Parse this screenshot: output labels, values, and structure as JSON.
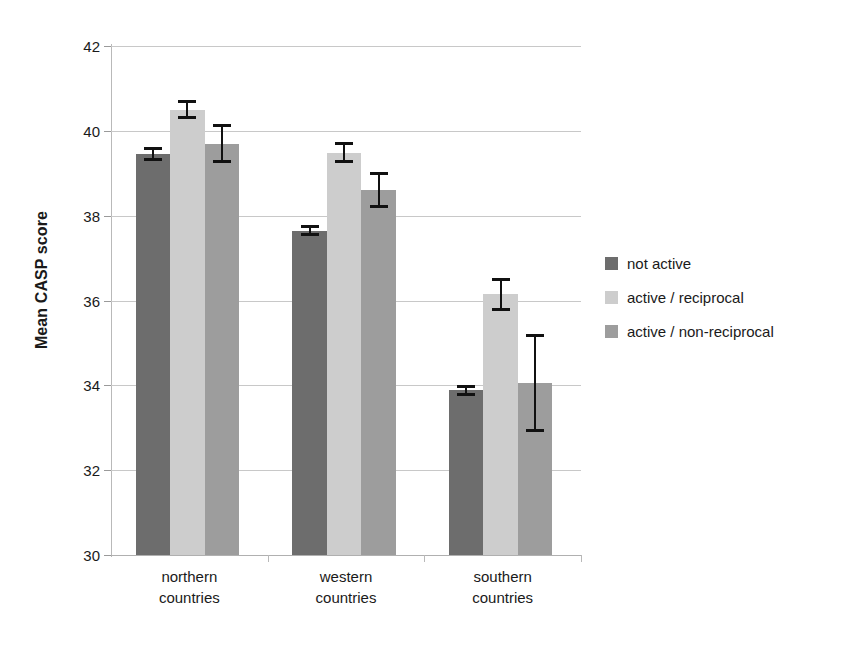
{
  "chart_data": {
    "type": "bar",
    "title": "",
    "xlabel": "",
    "ylabel": "Mean CASP score",
    "ylim": [
      30,
      42
    ],
    "yticks": [
      30,
      32,
      34,
      36,
      38,
      40,
      42
    ],
    "grid": true,
    "legend_position": "right",
    "categories": [
      "northern countries",
      "western countries",
      "southern countries"
    ],
    "category_lines": [
      [
        "northern",
        "countries"
      ],
      [
        "western",
        "countries"
      ],
      [
        "southern",
        "countries"
      ]
    ],
    "series": [
      {
        "name": "not active",
        "color": "#6d6d6d",
        "values": [
          39.45,
          37.65,
          33.88
        ],
        "errors": [
          0.17,
          0.12,
          0.13
        ]
      },
      {
        "name": "active / reciprocal",
        "color": "#cdcdcd",
        "values": [
          40.5,
          39.48,
          36.15
        ],
        "errors": [
          0.22,
          0.25,
          0.39
        ]
      },
      {
        "name": "active / non-reciprocal",
        "color": "#9d9d9d",
        "values": [
          39.7,
          38.6,
          34.05
        ],
        "errors": [
          0.45,
          0.42,
          1.15
        ]
      }
    ]
  },
  "legend": {
    "items": [
      {
        "label": "not active",
        "color": "#6d6d6d"
      },
      {
        "label": "active / reciprocal",
        "color": "#cdcdcd"
      },
      {
        "label": "active / non-reciprocal",
        "color": "#9d9d9d"
      }
    ]
  },
  "axis": {
    "y_title": "Mean CASP score",
    "y_tick_labels": [
      "42",
      "40",
      "38",
      "36",
      "34",
      "32",
      "30"
    ]
  }
}
